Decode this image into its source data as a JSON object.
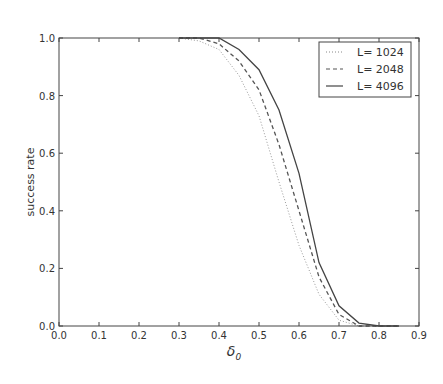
{
  "chart_data": {
    "type": "line",
    "title": "",
    "xlabel": "δ0",
    "ylabel": "success rate",
    "xlim": [
      0.0,
      0.9
    ],
    "ylim": [
      0.0,
      1.0
    ],
    "grid": false,
    "legend_position": "upper right",
    "x_ticks": [
      "0.0",
      "0.1",
      "0.2",
      "0.3",
      "0.4",
      "0.5",
      "0.6",
      "0.7",
      "0.8",
      "0.9"
    ],
    "y_ticks": [
      "0.0",
      "0.2",
      "0.4",
      "0.6",
      "0.8",
      "1.0"
    ],
    "x": [
      0.3,
      0.35,
      0.4,
      0.45,
      0.5,
      0.55,
      0.6,
      0.65,
      0.7,
      0.75,
      0.8,
      0.85
    ],
    "series": [
      {
        "name": "L= 1024",
        "style": "dotted",
        "values": [
          1.0,
          0.99,
          0.96,
          0.87,
          0.73,
          0.5,
          0.28,
          0.11,
          0.02,
          0.0,
          0.0,
          0.0
        ]
      },
      {
        "name": "L= 2048",
        "style": "dashed",
        "values": [
          1.0,
          1.0,
          0.98,
          0.92,
          0.82,
          0.63,
          0.4,
          0.17,
          0.04,
          0.0,
          0.0,
          0.0
        ]
      },
      {
        "name": "L= 4096",
        "style": "solid",
        "values": [
          1.0,
          1.0,
          1.0,
          0.96,
          0.89,
          0.75,
          0.53,
          0.22,
          0.07,
          0.01,
          0.0,
          0.0
        ]
      }
    ]
  },
  "legend": {
    "items": [
      {
        "label": "L= 1024"
      },
      {
        "label": "L= 2048"
      },
      {
        "label": "L= 4096"
      }
    ]
  },
  "axes": {
    "xlabel": "δ",
    "xlabel_sub": "0",
    "ylabel": "success rate"
  }
}
